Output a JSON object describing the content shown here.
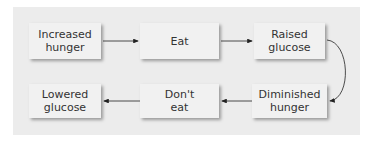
{
  "diagram": {
    "type": "flow-cycle",
    "nodes": [
      {
        "id": "increased-hunger",
        "label": "Increased\nhunger"
      },
      {
        "id": "eat",
        "label": "Eat"
      },
      {
        "id": "raised-glucose",
        "label": "Raised\nglucose"
      },
      {
        "id": "diminished-hunger",
        "label": "Diminished\nhunger"
      },
      {
        "id": "dont-eat",
        "label": "Don't\neat"
      },
      {
        "id": "lowered-glucose",
        "label": "Lowered\nglucose"
      }
    ],
    "edges": [
      {
        "from": "increased-hunger",
        "to": "eat"
      },
      {
        "from": "eat",
        "to": "raised-glucose"
      },
      {
        "from": "raised-glucose",
        "to": "diminished-hunger"
      },
      {
        "from": "diminished-hunger",
        "to": "dont-eat"
      },
      {
        "from": "dont-eat",
        "to": "lowered-glucose"
      }
    ],
    "colors": {
      "panel": "#ececec",
      "box": "#f1f1f1",
      "text": "#333333",
      "arrow": "#222222"
    }
  }
}
